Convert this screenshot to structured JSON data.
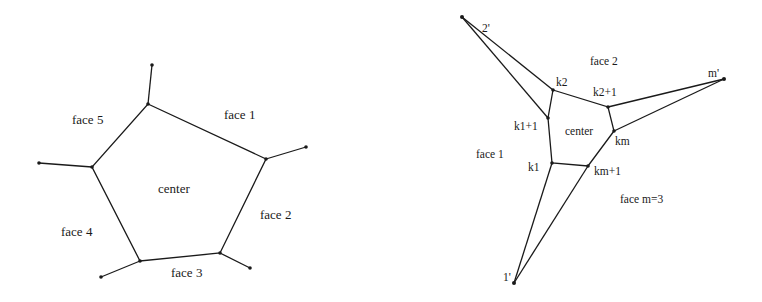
{
  "left_diagram": {
    "center_label": "center",
    "faces": [
      "face 1",
      "face 2",
      "face 3",
      "face 4",
      "face 5"
    ]
  },
  "right_diagram": {
    "center_label": "center",
    "faces": [
      "face 1",
      "face 2",
      "face m=3"
    ],
    "vertices": {
      "k2": "k2",
      "k2p1": "k2+1",
      "k1p1": "k1+1",
      "km": "km",
      "k1": "k1",
      "kmp1": "km+1",
      "one_prime": "1'",
      "two_prime": "2'",
      "m_prime": "m'"
    }
  }
}
